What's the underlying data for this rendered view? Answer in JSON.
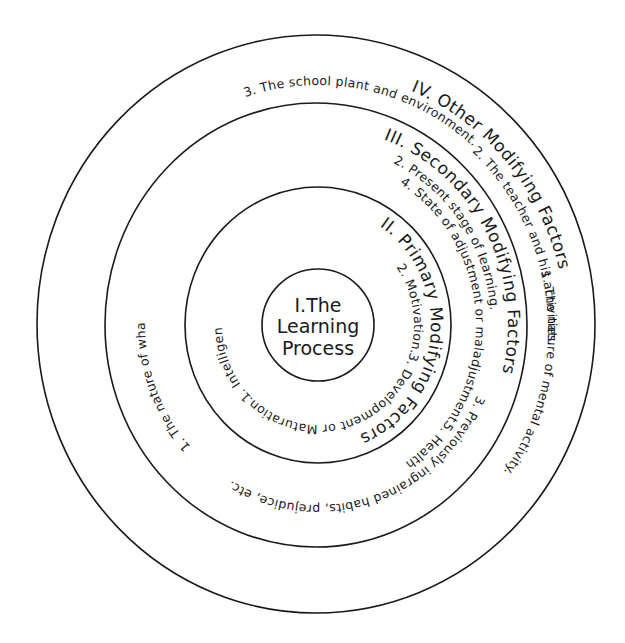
{
  "diagram": {
    "type": "concentric-circles",
    "center": {
      "label_line1": "I.The",
      "label_line2": "Learning",
      "label_line3": "Process"
    },
    "rings": [
      {
        "title": "II. Primary Modifying Factors",
        "items": [
          "1. Intelligence",
          "2. Motivation.",
          "3. Development or Maturation."
        ]
      },
      {
        "title": "III. Secondary Modifying Factors",
        "items": [
          "1. The nature of what is to be learned.",
          "2. Present stage of learning.",
          "3. Previously ingrained habits, prejudice, etc.",
          "4. State of adjustment or maladjustment.",
          "5. Health"
        ]
      },
      {
        "title": "IV. Other Modifying Factors",
        "items": [
          "1. The nature of mental activity.",
          "2. The teacher and his activities.",
          "3. The school plant and environment."
        ]
      }
    ]
  }
}
